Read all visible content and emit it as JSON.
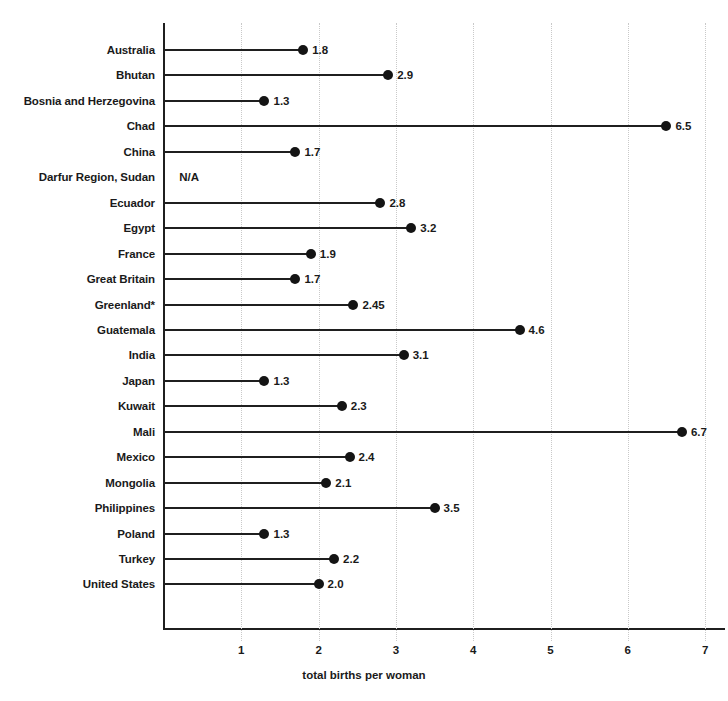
{
  "chart_data": {
    "type": "bar",
    "subtype": "lollipop-horizontal",
    "title": "",
    "xlabel": "total births per woman",
    "ylabel": "",
    "xlim": [
      0,
      7.3
    ],
    "xticks": [
      1,
      2,
      3,
      4,
      5,
      6,
      7
    ],
    "grid": "vertical-dotted",
    "legend": "none",
    "categories": [
      "Australia",
      "Bhutan",
      "Bosnia and Herzegovina",
      "Chad",
      "China",
      "Darfur Region, Sudan",
      "Ecuador",
      "Egypt",
      "France",
      "Great Britain",
      "Greenland*",
      "Guatemala",
      "India",
      "Japan",
      "Kuwait",
      "Mali",
      "Mexico",
      "Mongolia",
      "Philippines",
      "Poland",
      "Turkey",
      "United States"
    ],
    "values": [
      1.8,
      2.9,
      1.3,
      6.5,
      1.7,
      null,
      2.8,
      3.2,
      1.9,
      1.7,
      2.45,
      4.6,
      3.1,
      1.3,
      2.3,
      6.7,
      2.4,
      2.1,
      3.5,
      1.3,
      2.2,
      2.0
    ],
    "value_labels": [
      "1.8",
      "2.9",
      "1.3",
      "6.5",
      "1.7",
      "N/A",
      "2.8",
      "3.2",
      "1.9",
      "1.7",
      "2.45",
      "4.6",
      "3.1",
      "1.3",
      "2.3",
      "6.7",
      "2.4",
      "2.1",
      "3.5",
      "1.3",
      "2.2",
      "2.0"
    ],
    "missing_label": "N/A",
    "missing_label_x": 1.0,
    "colors": {
      "marker": "#141414",
      "stem": "#1f1f1f",
      "axis": "#1f1f1f",
      "grid": "#c9c9c9",
      "text": "#1a1a1a",
      "background": "#ffffff"
    }
  }
}
